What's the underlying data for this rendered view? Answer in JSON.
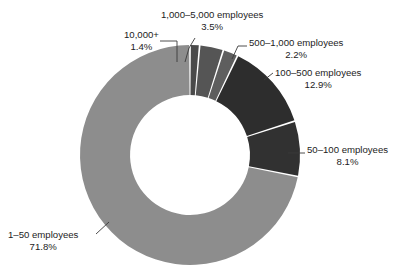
{
  "page": {
    "cut_caption": "",
    "background": "#ffffff"
  },
  "chart_data": {
    "type": "pie",
    "variant": "donut",
    "title": "",
    "xlabel": "",
    "ylabel": "",
    "legend_position": "none",
    "grid": false,
    "label_format": "category + percentage",
    "units": "percent",
    "start_angle_deg": 0,
    "direction": "clockwise",
    "inner_radius_ratio": 0.545,
    "categories": [
      "10,000+",
      "1,000–5,000 employees",
      "500–1,000 employees",
      "100–500 employees",
      "50–100 employees",
      "1–50 employees"
    ],
    "values": [
      1.4,
      3.5,
      2.2,
      12.9,
      8.1,
      71.8
    ],
    "slices": [
      {
        "label": "10,000+",
        "pct_text": "1.4%",
        "value": 1.4,
        "color": "#4a4a4a"
      },
      {
        "label": "1,000–5,000 employees",
        "pct_text": "3.5%",
        "value": 3.5,
        "color": "#555555"
      },
      {
        "label": "500–1,000 employees",
        "pct_text": "2.2%",
        "value": 2.2,
        "color": "#5e5e5e"
      },
      {
        "label": "100–500 employees",
        "pct_text": "12.9%",
        "value": 12.9,
        "color": "#2d2d2d"
      },
      {
        "label": "50–100 employees",
        "pct_text": "8.1%",
        "value": 8.1,
        "color": "#313131"
      },
      {
        "label": "1–50 employees",
        "pct_text": "71.8%",
        "value": 71.8,
        "color": "#8d8d8d"
      }
    ],
    "colors": {
      "dominant_slice": "#8d8d8d",
      "dark_slice": "#2d2d2d",
      "separator": "#ffffff",
      "leader_line": "#3a3a3a",
      "text": "#1c1c1c"
    }
  }
}
